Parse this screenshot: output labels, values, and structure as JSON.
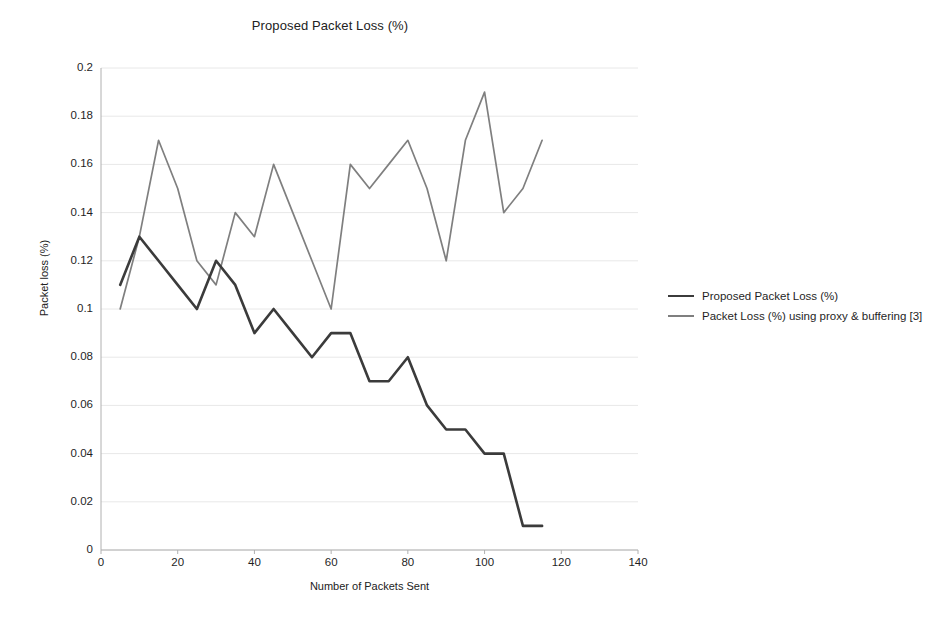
{
  "chart_data": {
    "type": "line",
    "title": "Proposed Packet Loss (%)",
    "xlabel": "Number of Packets Sent",
    "ylabel": "Packet loss (%)",
    "xlim": [
      0,
      140
    ],
    "ylim": [
      0,
      0.2
    ],
    "xticks": [
      0,
      20,
      40,
      60,
      80,
      100,
      120,
      140
    ],
    "yticks": [
      0,
      0.02,
      0.04,
      0.06,
      0.08,
      0.1,
      0.12,
      0.14,
      0.16,
      0.18,
      0.2
    ],
    "xtick_labels": [
      "0",
      "20",
      "40",
      "60",
      "80",
      "100",
      "120",
      "140"
    ],
    "ytick_labels": [
      "0",
      "0.02",
      "0.04",
      "0.06",
      "0.08",
      "0.1",
      "0.12",
      "0.14",
      "0.16",
      "0.18",
      "0.2"
    ],
    "grid": "horizontal",
    "legend_position": "right",
    "series": [
      {
        "name": "Proposed Packet Loss (%)",
        "color": "#3b3b3b",
        "x": [
          5,
          10,
          15,
          20,
          25,
          30,
          35,
          40,
          45,
          50,
          55,
          60,
          65,
          70,
          75,
          80,
          85,
          90,
          95,
          100,
          105,
          110,
          115
        ],
        "values": [
          0.11,
          0.13,
          0.12,
          0.11,
          0.1,
          0.12,
          0.11,
          0.09,
          0.1,
          0.09,
          0.08,
          0.09,
          0.09,
          0.07,
          0.07,
          0.08,
          0.06,
          0.05,
          0.05,
          0.04,
          0.04,
          0.01,
          0.01
        ]
      },
      {
        "name": "Packet Loss (%) using proxy & buffering [3]",
        "color": "#7f7f7f",
        "x": [
          5,
          10,
          15,
          20,
          25,
          30,
          35,
          40,
          45,
          50,
          55,
          60,
          65,
          70,
          75,
          80,
          85,
          90,
          95,
          100,
          105,
          110,
          115
        ],
        "values": [
          0.1,
          0.13,
          0.17,
          0.15,
          0.12,
          0.11,
          0.14,
          0.13,
          0.16,
          0.14,
          0.12,
          0.1,
          0.16,
          0.15,
          0.16,
          0.17,
          0.15,
          0.12,
          0.17,
          0.19,
          0.14,
          0.15,
          0.17
        ]
      }
    ]
  },
  "legend": {
    "items": [
      {
        "label": "Proposed Packet Loss (%)",
        "color": "#3b3b3b"
      },
      {
        "label": "Packet Loss (%) using proxy & buffering [3]",
        "color": "#7f7f7f"
      }
    ]
  },
  "colors": {
    "background": "#ffffff",
    "grid": "#e8e8e8",
    "axis": "#b0b0b0",
    "text": "#1f1f1f",
    "series_proposed": "#3b3b3b",
    "series_proxy": "#7f7f7f"
  }
}
